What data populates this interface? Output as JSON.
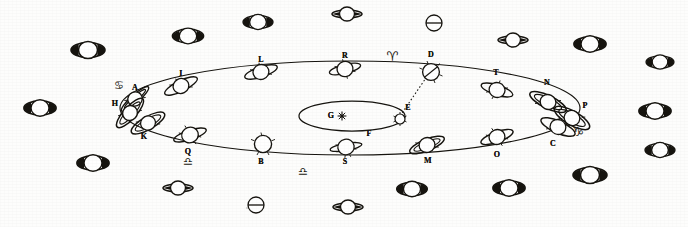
{
  "figure": {
    "ink_color": "#16140f",
    "paper_color": "#fdfdfc"
  },
  "center": {
    "sun_label": "G",
    "sun_glyph": "star-burst",
    "inner_ellipse_label": "F",
    "earth_orbit_point_label": "E",
    "sight_line_from": "E",
    "sight_line_to": "D",
    "sight_line_style": "dotted"
  },
  "orbit": {
    "label": "Saturn orbit ellipse",
    "stations": [
      {
        "id": "A",
        "label": "A",
        "x": 135,
        "y": 92,
        "phase": "ring-edge-narrow"
      },
      {
        "id": "I",
        "label": "I",
        "x": 181,
        "y": 78,
        "phase": "ring-open-tilted"
      },
      {
        "id": "L",
        "label": "L",
        "x": 261,
        "y": 65,
        "phase": "ring-open-tilted"
      },
      {
        "id": "R",
        "label": "R",
        "x": 345,
        "y": 62,
        "phase": "ring-open"
      },
      {
        "id": "D",
        "label": "D",
        "x": 431,
        "y": 68,
        "phase": "ring-edge-on"
      },
      {
        "id": "T",
        "label": "T",
        "x": 497,
        "y": 82,
        "phase": "ring-slightly-open"
      },
      {
        "id": "N",
        "label": "N",
        "x": 546,
        "y": 94,
        "phase": "ring-open-tilted"
      },
      {
        "id": "P",
        "label": "P",
        "x": 575,
        "y": 112,
        "phase": "ring-wide-open"
      },
      {
        "id": "C",
        "label": "C",
        "x": 560,
        "y": 133,
        "phase": "ring-wide-open"
      },
      {
        "id": "O",
        "label": "O",
        "x": 497,
        "y": 144,
        "phase": "ring-open-tilted"
      },
      {
        "id": "M",
        "label": "M",
        "x": 427,
        "y": 152,
        "phase": "ring-open-tilted"
      },
      {
        "id": "S",
        "label": "S",
        "x": 346,
        "y": 155,
        "phase": "ring-edge-narrow"
      },
      {
        "id": "B",
        "label": "B",
        "x": 263,
        "y": 152,
        "phase": "ring-edge-on"
      },
      {
        "id": "Q",
        "label": "Q",
        "x": 186,
        "y": 143,
        "phase": "ring-edge-narrow"
      },
      {
        "id": "K",
        "label": "K",
        "x": 144,
        "y": 129,
        "phase": "ring-open-tilted"
      },
      {
        "id": "H",
        "label": "H",
        "x": 124,
        "y": 108,
        "phase": "ring-wide-open"
      }
    ]
  },
  "zodiac_marks": [
    {
      "name": "cancer-symbol",
      "glyph": "♋",
      "x": 119,
      "y": 85,
      "note": "near station A"
    },
    {
      "name": "aries-symbol",
      "glyph": "♈",
      "x": 392,
      "y": 55,
      "note": "near station D"
    },
    {
      "name": "libra-symbol",
      "glyph": "♎",
      "x": 188,
      "y": 160,
      "note": "near station Q"
    },
    {
      "name": "libra-alt-symbol",
      "glyph": "♎",
      "x": 303,
      "y": 170,
      "note": "near station B"
    },
    {
      "name": "capricorn-symbol",
      "glyph": "♑",
      "x": 578,
      "y": 131,
      "note": "near station P"
    }
  ],
  "border_glyphs": {
    "description": "Scattered engraved ringed-planet and phase glyphs surrounding the orbit figure",
    "items": [
      {
        "name": "saturn-glyph-ring-open",
        "x": 88,
        "y": 50,
        "w": 36,
        "h": 17,
        "type": "open"
      },
      {
        "name": "saturn-glyph-ring-open",
        "x": 188,
        "y": 36,
        "w": 32,
        "h": 15,
        "type": "open"
      },
      {
        "name": "saturn-glyph-ring-open",
        "x": 258,
        "y": 22,
        "w": 32,
        "h": 14,
        "type": "open"
      },
      {
        "name": "saturn-glyph-ring-narrow",
        "x": 347,
        "y": 14,
        "w": 30,
        "h": 13,
        "type": "narrow"
      },
      {
        "name": "globe-bisected-glyph",
        "x": 434,
        "y": 23,
        "w": 17,
        "h": 17,
        "type": "bisected"
      },
      {
        "name": "saturn-glyph-ring-narrow",
        "x": 513,
        "y": 40,
        "w": 30,
        "h": 13,
        "type": "narrow"
      },
      {
        "name": "saturn-glyph-ring-open",
        "x": 590,
        "y": 44,
        "w": 34,
        "h": 15,
        "type": "open"
      },
      {
        "name": "saturn-glyph-ring-open",
        "x": 652,
        "y": 111,
        "w": 34,
        "h": 16,
        "type": "open"
      },
      {
        "name": "saturn-glyph-ring-open",
        "x": 648,
        "y": 62,
        "w": 28,
        "h": 13,
        "type": "open"
      },
      {
        "name": "saturn-glyph-ring-open",
        "x": 40,
        "y": 108,
        "w": 34,
        "h": 16,
        "type": "open"
      },
      {
        "name": "saturn-glyph-ring-open",
        "x": 93,
        "y": 163,
        "w": 34,
        "h": 16,
        "type": "open"
      },
      {
        "name": "saturn-glyph-ring-narrow",
        "x": 178,
        "y": 188,
        "w": 30,
        "h": 14,
        "type": "narrow"
      },
      {
        "name": "globe-bisected-glyph",
        "x": 256,
        "y": 205,
        "w": 17,
        "h": 17,
        "type": "bisected"
      },
      {
        "name": "saturn-glyph-ring-narrow",
        "x": 348,
        "y": 207,
        "w": 30,
        "h": 13,
        "type": "narrow"
      },
      {
        "name": "saturn-glyph-ring-open",
        "x": 412,
        "y": 189,
        "w": 32,
        "h": 15,
        "type": "open"
      },
      {
        "name": "saturn-glyph-ring-open",
        "x": 509,
        "y": 188,
        "w": 34,
        "h": 16,
        "type": "open"
      },
      {
        "name": "saturn-glyph-ring-open",
        "x": 590,
        "y": 175,
        "w": 34,
        "h": 17,
        "type": "open"
      },
      {
        "name": "saturn-glyph-ring-open",
        "x": 654,
        "y": 150,
        "w": 30,
        "h": 15,
        "type": "open"
      },
      {
        "name": "globe-bisected-glyph",
        "x": 247,
        "y": 208,
        "w": 16,
        "h": 16,
        "type": "bisected"
      }
    ]
  }
}
